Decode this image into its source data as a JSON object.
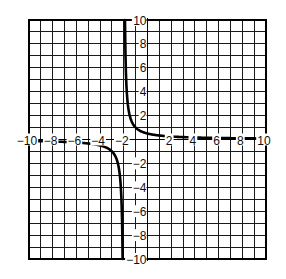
{
  "chart_data": {
    "type": "line",
    "title": "",
    "xlabel": "",
    "ylabel": "",
    "xlim": [
      -10,
      10
    ],
    "ylim": [
      -10,
      10
    ],
    "grid": true,
    "grid_step": 1,
    "legend": null,
    "x_ticks": [
      -10,
      -8,
      -6,
      -4,
      -2,
      2,
      4,
      6,
      8,
      10
    ],
    "x_tick_labels": [
      "−10",
      "−8",
      "−6",
      "−4",
      "−2",
      "2",
      "4",
      "6",
      "8",
      "10"
    ],
    "y_ticks": [
      10,
      8,
      6,
      4,
      2,
      -2,
      -4,
      -6,
      -8,
      -10
    ],
    "y_tick_labels": [
      "10",
      "8",
      "6",
      "4",
      "2",
      "−2",
      "−4",
      "−6",
      "−8",
      "−10"
    ],
    "series": [
      {
        "name": "y = 1/(x+2)",
        "description": "Hyperbola with vertical asymptote x = -2 and horizontal asymptote y = 0",
        "vertical_asymptote": -2,
        "horizontal_asymptote": 0,
        "branches": [
          {
            "name": "right-branch",
            "x": [
              -1.9,
              -1.8,
              -1.7,
              -1.6,
              -1.5,
              -1.25,
              -1,
              -0.5,
              0,
              1,
              2,
              3,
              4,
              5,
              6,
              7,
              8,
              9,
              10
            ],
            "y": [
              10,
              5,
              3.33,
              2.5,
              2,
              1.33,
              1,
              0.67,
              0.5,
              0.33,
              0.25,
              0.2,
              0.17,
              0.14,
              0.13,
              0.11,
              0.1,
              0.09,
              0.08
            ]
          },
          {
            "name": "left-branch",
            "x": [
              -10,
              -9,
              -8,
              -7,
              -6,
              -5,
              -4,
              -3,
              -2.75,
              -2.5,
              -2.4,
              -2.3,
              -2.2,
              -2.1
            ],
            "y": [
              -0.13,
              -0.14,
              -0.17,
              -0.2,
              -0.25,
              -0.33,
              -0.5,
              -1,
              -1.33,
              -2,
              -2.5,
              -3.33,
              -5,
              -10
            ]
          }
        ]
      }
    ]
  },
  "plot": {
    "line_color": "#000000",
    "grid_color": "#1a1a1a",
    "background": "#ffffff"
  }
}
